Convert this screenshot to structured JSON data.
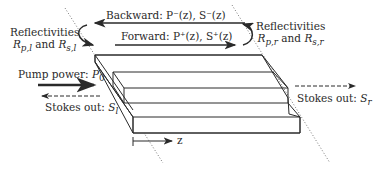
{
  "diagram": {
    "backward_label": "Backward: P⁻(z), S⁻(z)",
    "forward_label": "Forward: P⁺(z), S⁺(z)",
    "left_reflect": {
      "line1": "Reflectivities",
      "line2": "R_p,l and R_s,l",
      "rp": "R",
      "rp_sub": "p,l",
      "and": " and ",
      "rs": "R",
      "rs_sub": "s,l"
    },
    "right_reflect": {
      "line1": "Reflectivities",
      "rp": "R",
      "rp_sub": "p,r",
      "and": " and ",
      "rs": "R",
      "rs_sub": "s,r"
    },
    "pump": {
      "text": "Pump power: ",
      "sym": "P",
      "sub": "0"
    },
    "stokes_left": {
      "text": "Stokes out: ",
      "sym": "S",
      "sub": "l"
    },
    "stokes_right": {
      "text": "Stokes out: ",
      "sym": "S",
      "sub": "r"
    },
    "z_axis": "z",
    "colors": {
      "line": "#2a2a2a",
      "dotted": "#555555"
    }
  }
}
